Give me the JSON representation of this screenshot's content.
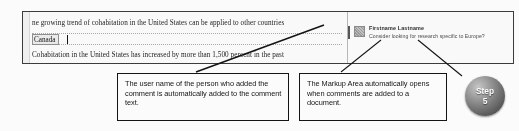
{
  "document": {
    "lines": [
      "ne growing trend of cohabitation in the United States can be applied to other countries",
      "Cohabitation in the United States has increased by more than 1,500 percent in the past"
    ],
    "field": {
      "value": "Canada",
      "name": "country-content-control"
    }
  },
  "markup_pane": {
    "comment": {
      "author": "Firstname Lastname",
      "text": "Consider looking for research specific to Europe?",
      "avatar_icon": "user-avatar-placeholder-icon"
    }
  },
  "callouts": [
    {
      "id": "username-callout",
      "text": "The user name of the person who added the comment is automatically added to the comment text."
    },
    {
      "id": "markup-area-callout",
      "text": "The Markup Area automatically opens when comments are added to a document."
    }
  ],
  "step_badge": {
    "label": "Step",
    "number": "5"
  },
  "colors": {
    "doc_border": "#3a3a3a",
    "callout_border": "#111111",
    "field_fill": "#ededed",
    "comment_author": "#2b2b2b",
    "comment_body": "#4a4a4a",
    "badge_text": "#ffffff"
  }
}
